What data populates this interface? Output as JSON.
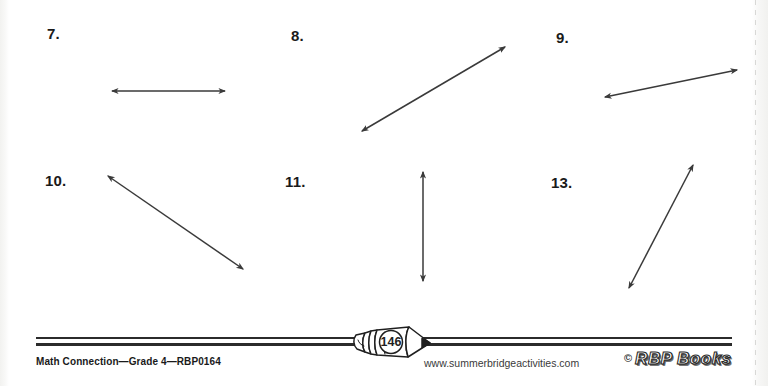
{
  "worksheet": {
    "problems": [
      {
        "number": "7.",
        "label_x": 47,
        "label_y": 25,
        "figure": "double-headed-arrow",
        "orientation": "horizontal",
        "x1": 112,
        "y1": 91,
        "x2": 225,
        "y2": 91
      },
      {
        "number": "8.",
        "label_x": 291,
        "label_y": 27,
        "figure": "double-headed-arrow",
        "orientation": "diagonal-up-right",
        "x1": 362,
        "y1": 131,
        "x2": 505,
        "y2": 47
      },
      {
        "number": "9.",
        "label_x": 556,
        "label_y": 29,
        "figure": "double-headed-arrow",
        "orientation": "diagonal-shallow-up-right",
        "x1": 605,
        "y1": 97,
        "x2": 737,
        "y2": 70
      },
      {
        "number": "10.",
        "label_x": 45,
        "label_y": 172,
        "figure": "double-headed-arrow",
        "orientation": "diagonal-down-right",
        "x1": 108,
        "y1": 176,
        "x2": 243,
        "y2": 269
      },
      {
        "number": "11.",
        "label_x": 285,
        "label_y": 173,
        "figure": "double-headed-arrow",
        "orientation": "vertical",
        "x1": 423,
        "y1": 172,
        "x2": 423,
        "y2": 281
      },
      {
        "number": "13.",
        "label_x": 551,
        "label_y": 174,
        "figure": "double-headed-arrow",
        "orientation": "diagonal-steep-up-right",
        "x1": 629,
        "y1": 288,
        "x2": 693,
        "y2": 165
      }
    ]
  },
  "footer": {
    "left_text": "Math Connection—Grade 4—RBP0164",
    "url": "www.summerbridgeactivities.com",
    "page_number": "146",
    "logo": {
      "copyright": "©",
      "name": "RBP Books"
    }
  },
  "colors": {
    "ink": "#2b2b2b",
    "arrow": "#3a3a3a",
    "paper": "#ffffff"
  }
}
